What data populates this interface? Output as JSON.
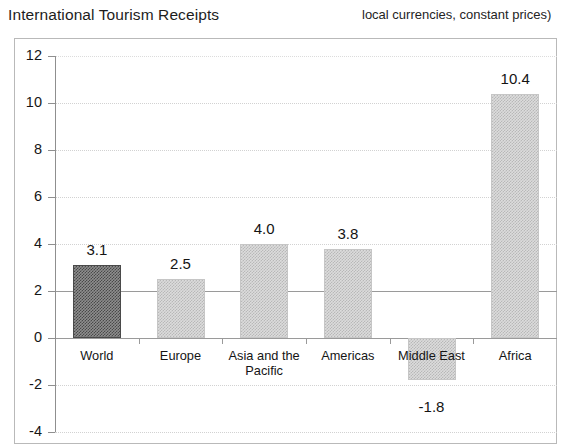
{
  "header": {
    "title": "International Tourism Receipts",
    "subtitle": "local currencies, constant prices)"
  },
  "chart_data": {
    "type": "bar",
    "title": "International Tourism Receipts",
    "subtitle": "local currencies, constant prices)",
    "xlabel": "",
    "ylabel": "",
    "ylim": [
      -4,
      12
    ],
    "ytick_step": 2,
    "yticks": [
      "12",
      "10",
      "8",
      "6",
      "4",
      "2",
      "0",
      "-2",
      "-4"
    ],
    "grid": true,
    "legend": "none",
    "categories": [
      "World",
      "Europe",
      "Asia and the Pacific",
      "Americas",
      "Middle East",
      "Africa"
    ],
    "values": [
      3.1,
      2.5,
      4.0,
      3.8,
      -1.8,
      10.4
    ],
    "value_labels": [
      "3.1",
      "2.5",
      "4.0",
      "3.8",
      "-1.8",
      "10.4"
    ],
    "highlighted_category": "World",
    "colors": {
      "bar_default": "#dcdcdc",
      "bar_highlight": "#8e8e8e",
      "axis": "#8f8f8f",
      "gridline": "#d2d2d2",
      "text": "#161616",
      "frame": "#b9b9b9",
      "background": "#ffffff"
    }
  }
}
